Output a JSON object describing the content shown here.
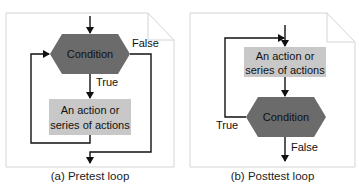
{
  "diagrams": [
    {
      "id": "pretest",
      "caption": "(a) Pretest loop",
      "condition_label": "Condition",
      "action_label_line1": "An action or",
      "action_label_line2": "series of actions",
      "true_label": "True",
      "false_label": "False"
    },
    {
      "id": "posttest",
      "caption": "(b) Posttest loop",
      "condition_label": "Condition",
      "action_label_line1": "An action or",
      "action_label_line2": "series of actions",
      "true_label": "True",
      "false_label": "False"
    }
  ],
  "colors": {
    "condition_fill": "#6b6b6b",
    "action_fill": "#c8c8c8",
    "panel_border": "#d4d4d4",
    "line": "#111111"
  }
}
